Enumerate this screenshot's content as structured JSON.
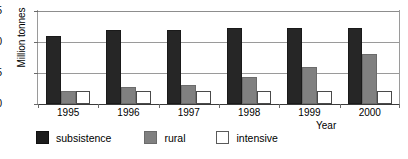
{
  "chart_data": {
    "type": "bar",
    "title": "",
    "xlabel": "Year",
    "ylabel": "Million tonnes",
    "categories": [
      "1995",
      "1996",
      "1997",
      "1998",
      "1999",
      "2000"
    ],
    "series": [
      {
        "name": "subsistence",
        "color": "#262626",
        "values": [
          1.1,
          1.19,
          1.19,
          1.22,
          1.22,
          1.22
        ]
      },
      {
        "name": "rural",
        "color": "#808080",
        "values": [
          0.21,
          0.28,
          0.3,
          0.44,
          0.6,
          0.8
        ]
      },
      {
        "name": "intensive",
        "color": "#ffffff",
        "values": [
          0.21,
          0.21,
          0.21,
          0.21,
          0.21,
          0.21
        ]
      }
    ],
    "ylim": [
      0.0,
      1.5
    ],
    "yticks": [
      "0.0",
      "0.5",
      "1.0",
      "1.5"
    ],
    "ytick_values": [
      0.0,
      0.5,
      1.0,
      1.5
    ],
    "grid": true,
    "legend_position": "bottom-left"
  },
  "axes": {
    "y_title": "Million tonnes",
    "x_title": "Year"
  },
  "legend": {
    "items": [
      {
        "label": "subsistence",
        "swatch": "black-square"
      },
      {
        "label": "rural",
        "swatch": "gray-square"
      },
      {
        "label": "intensive",
        "swatch": "white-square"
      }
    ]
  },
  "footnote": {
    "text": ""
  }
}
